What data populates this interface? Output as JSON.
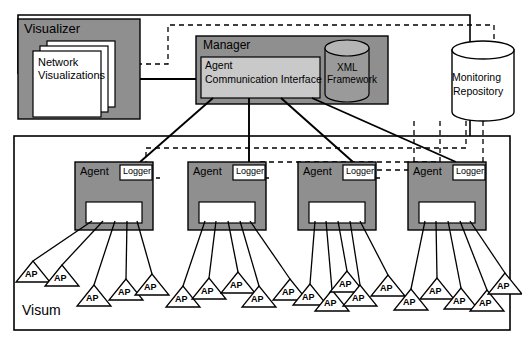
{
  "diagram": {
    "title_label": "Visum",
    "colors": {
      "gray_fill": "#8f8f8f",
      "white_fill": "#ffffff",
      "stroke": "#000000",
      "cyl_fill": "#9a9a9a"
    }
  },
  "visualizer": {
    "label": "Visualizer",
    "cards": {
      "label_line1": "Network",
      "label_line2": "Visualizations",
      "count": 3
    }
  },
  "manager": {
    "label": "Manager",
    "interface": {
      "line1": "Agent",
      "line2": "Communication Interface"
    },
    "xml": {
      "line1": "XML",
      "line2": "Framework"
    }
  },
  "repository": {
    "line1": "Monitoring",
    "line2": "Repository"
  },
  "agents": [
    {
      "label": "Agent",
      "logger_label": "Logger",
      "x": 75
    },
    {
      "label": "Agent",
      "logger_label": "Logger",
      "x": 188
    },
    {
      "label": "Agent",
      "logger_label": "Logger",
      "x": 298
    },
    {
      "label": "Agent",
      "logger_label": "Logger",
      "x": 408
    }
  ],
  "access_points": {
    "label": "AP",
    "count": 20,
    "positions": [
      {
        "x": 33,
        "y": 268
      },
      {
        "x": 62,
        "y": 272
      },
      {
        "x": 94,
        "y": 292
      },
      {
        "x": 126,
        "y": 286
      },
      {
        "x": 152,
        "y": 281
      },
      {
        "x": 183,
        "y": 293
      },
      {
        "x": 209,
        "y": 285
      },
      {
        "x": 238,
        "y": 279
      },
      {
        "x": 259,
        "y": 293
      },
      {
        "x": 290,
        "y": 286
      },
      {
        "x": 310,
        "y": 291
      },
      {
        "x": 332,
        "y": 297
      },
      {
        "x": 360,
        "y": 292
      },
      {
        "x": 388,
        "y": 282
      },
      {
        "x": 411,
        "y": 296
      },
      {
        "x": 437,
        "y": 285
      },
      {
        "x": 461,
        "y": 295
      },
      {
        "x": 487,
        "y": 297
      },
      {
        "x": 505,
        "y": 280
      },
      {
        "x": 347,
        "y": 278
      }
    ]
  }
}
